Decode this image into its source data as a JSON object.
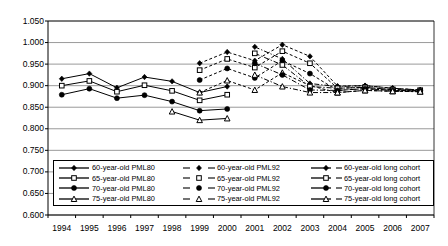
{
  "chart_data": {
    "type": "line",
    "title": "",
    "xlabel": "",
    "ylabel": "",
    "x": [
      1994,
      1995,
      1996,
      1997,
      1998,
      1999,
      2000,
      2001,
      2002,
      2003,
      2004,
      2005,
      2006,
      2007
    ],
    "ylim": [
      0.6,
      1.05
    ],
    "yticks": [
      0.6,
      0.65,
      0.7,
      0.75,
      0.8,
      0.85,
      0.9,
      0.95,
      1.0,
      1.05
    ],
    "ytick_labels": [
      "0.600",
      "0.650",
      "0.700",
      "0.750",
      "0.800",
      "0.850",
      "0.900",
      "0.950",
      "1.000",
      "1.050"
    ],
    "xtick_labels": [
      "1994",
      "1995",
      "1996",
      "1997",
      "1998",
      "1999",
      "2000",
      "2001",
      "2002",
      "2003",
      "2004",
      "2005",
      "2006",
      "2007"
    ],
    "grid": "horizontal",
    "legend_position": "bottom-inside",
    "series": [
      {
        "name": "60-year-old PML80",
        "marker": "diamond-filled",
        "line": "solid",
        "values": [
          0.916,
          0.928,
          0.895,
          0.92,
          0.91,
          0.884,
          0.898,
          null,
          null,
          null,
          null,
          null,
          null,
          null
        ]
      },
      {
        "name": "65-year-old PML80",
        "marker": "square-open",
        "line": "solid",
        "values": [
          0.9,
          0.911,
          0.886,
          0.901,
          0.888,
          0.866,
          0.879,
          null,
          null,
          null,
          null,
          null,
          null,
          null
        ]
      },
      {
        "name": "70-year-old PML80",
        "marker": "circle-filled",
        "line": "solid",
        "values": [
          0.879,
          0.893,
          0.871,
          0.878,
          0.863,
          0.842,
          0.846,
          null,
          null,
          null,
          null,
          null,
          null,
          null
        ]
      },
      {
        "name": "75-year-old PML80",
        "marker": "triangle-open",
        "line": "solid",
        "values": [
          null,
          null,
          null,
          null,
          0.84,
          0.82,
          0.824,
          null,
          null,
          null,
          null,
          null,
          null,
          null
        ]
      },
      {
        "name": "60-year-old PML92",
        "marker": "diamond-filled",
        "line": "dashed",
        "values": [
          null,
          null,
          null,
          null,
          null,
          0.952,
          0.978,
          0.958,
          0.995,
          0.968,
          0.899,
          0.9,
          0.894,
          0.89
        ]
      },
      {
        "name": "65-year-old PML92",
        "marker": "square-open",
        "line": "dashed",
        "values": [
          null,
          null,
          null,
          null,
          null,
          0.936,
          0.962,
          0.942,
          0.98,
          0.952,
          0.894,
          0.896,
          0.891,
          0.889
        ]
      },
      {
        "name": "70-year-old PML92",
        "marker": "circle-filled",
        "line": "dashed",
        "values": [
          null,
          null,
          null,
          null,
          null,
          0.913,
          0.94,
          0.918,
          0.958,
          0.928,
          0.889,
          0.893,
          0.889,
          0.888
        ]
      },
      {
        "name": "75-year-old PML92",
        "marker": "triangle-open",
        "line": "dashed",
        "values": [
          null,
          null,
          null,
          null,
          null,
          0.884,
          0.912,
          0.89,
          0.93,
          0.9,
          0.884,
          0.889,
          0.887,
          0.886
        ]
      },
      {
        "name": "60-year-old long cohort",
        "marker": "diamond-filled",
        "line": "dash-dot",
        "values": [
          null,
          null,
          null,
          null,
          null,
          null,
          null,
          0.99,
          0.962,
          0.905,
          0.898,
          0.9,
          0.894,
          0.89
        ]
      },
      {
        "name": "65-year-old long cohort",
        "marker": "square-open",
        "line": "dash-dot",
        "values": [
          null,
          null,
          null,
          null,
          null,
          null,
          null,
          0.975,
          0.948,
          0.898,
          0.894,
          0.896,
          0.891,
          0.889
        ]
      },
      {
        "name": "70-year-old long cohort",
        "marker": "circle-filled",
        "line": "dash-dot",
        "values": [
          null,
          null,
          null,
          null,
          null,
          null,
          null,
          0.952,
          0.925,
          0.89,
          0.889,
          0.893,
          0.889,
          0.888
        ]
      },
      {
        "name": "75-year-old long cohort",
        "marker": "triangle-open",
        "line": "dash-dot",
        "values": [
          null,
          null,
          null,
          null,
          null,
          null,
          null,
          0.925,
          0.898,
          0.884,
          0.884,
          0.889,
          0.887,
          0.886
        ]
      }
    ]
  },
  "legend": {
    "columns": [
      {
        "entries": [
          {
            "label": "60-year-old PML80",
            "marker": "diamond-filled",
            "line": "solid"
          },
          {
            "label": "65-year-old PML80",
            "marker": "square-open",
            "line": "solid"
          },
          {
            "label": "70-year-old PML80",
            "marker": "circle-filled",
            "line": "solid"
          },
          {
            "label": "75-year-old PML80",
            "marker": "triangle-open",
            "line": "solid"
          }
        ]
      },
      {
        "entries": [
          {
            "label": "60-year-old PML92",
            "marker": "diamond-filled",
            "line": "dashed"
          },
          {
            "label": "65-year-old PML92",
            "marker": "square-open",
            "line": "dashed"
          },
          {
            "label": "70-year-old PML92",
            "marker": "circle-filled",
            "line": "dashed"
          },
          {
            "label": "75-year-old PML92",
            "marker": "triangle-open",
            "line": "dashed"
          }
        ]
      },
      {
        "entries": [
          {
            "label": "60-year-old long cohort",
            "marker": "diamond-filled",
            "line": "dash-dot"
          },
          {
            "label": "65-year-old long cohort",
            "marker": "square-open",
            "line": "dash-dot"
          },
          {
            "label": "70-year-old long cohort",
            "marker": "circle-filled",
            "line": "dash-dot"
          },
          {
            "label": "75-year-old long cohort",
            "marker": "triangle-open",
            "line": "dash-dot"
          }
        ]
      }
    ]
  },
  "colors": {
    "line": "#000000",
    "grid": "#808080",
    "axis": "#000000",
    "background": "#ffffff",
    "text": "#000000"
  }
}
